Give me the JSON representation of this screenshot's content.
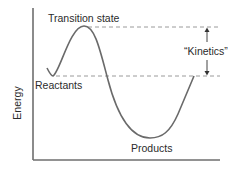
{
  "diagram": {
    "y_axis_label": "Energy",
    "x_axis_label": "",
    "labels": {
      "transition_state": "Transition state",
      "reactants": "Reactants",
      "products": "Products",
      "kinetics": "“Kinetics”"
    },
    "levels": {
      "transition_state_relative": 1.0,
      "reactants_relative": 0.55,
      "products_relative": 0.0
    },
    "annotations": [
      {
        "type": "double-arrow",
        "between": [
          "transition_state",
          "reactants"
        ],
        "label": "“Kinetics”"
      }
    ]
  }
}
